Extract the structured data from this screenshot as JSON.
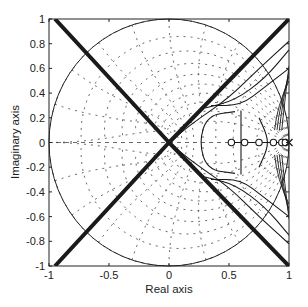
{
  "chart_data": {
    "type": "line",
    "title": "",
    "xlabel": "Real axis",
    "ylabel": "Imaginary axis",
    "xlim": [
      -1,
      1
    ],
    "ylim": [
      -1,
      1
    ],
    "grid": "zgrid (damping/natural-frequency dotted grid)",
    "legend": "none",
    "xticks": [
      -1,
      -0.5,
      0,
      0.5,
      1
    ],
    "xtick_labels": [
      "-1",
      "-0.5",
      "0",
      "0.5",
      "1"
    ],
    "yticks": [
      1,
      0.8,
      0.6,
      0.4,
      0.2,
      0,
      -0.2,
      -0.4,
      -0.6,
      -0.8,
      -1
    ],
    "ytick_labels": [
      "1",
      "0.8",
      "0.6",
      "0.4",
      "0.2",
      "0",
      "-0.2",
      "-0.4",
      "-0.6",
      "-0.8",
      "-1"
    ],
    "unit_circle": {
      "center": [
        0,
        0
      ],
      "radius": 1
    },
    "poles": [
      [
        1.0,
        0
      ]
    ],
    "zeros": [
      [
        0.52,
        0
      ],
      [
        0.63,
        0
      ],
      [
        0.75,
        0
      ],
      [
        0.87,
        0
      ],
      [
        0.94,
        0
      ],
      [
        0.97,
        0
      ]
    ],
    "series": [
      {
        "name": "asymptote-diagonal-1",
        "style": "thick",
        "points": [
          [
            -0.95,
            1
          ],
          [
            0,
            0
          ],
          [
            1,
            -1
          ]
        ]
      },
      {
        "name": "asymptote-diagonal-2",
        "style": "thick",
        "points": [
          [
            -0.95,
            -1
          ],
          [
            0,
            0
          ],
          [
            1,
            1
          ]
        ]
      },
      {
        "name": "branch-upper-outer",
        "points": [
          [
            0,
            0
          ],
          [
            0.2,
            0.16
          ],
          [
            0.5,
            0.36
          ],
          [
            0.75,
            0.6
          ],
          [
            1,
            0.82
          ]
        ]
      },
      {
        "name": "branch-upper-mid",
        "points": [
          [
            0.3,
            0.28
          ],
          [
            0.55,
            0.34
          ],
          [
            0.8,
            0.52
          ],
          [
            1,
            0.75
          ]
        ]
      },
      {
        "name": "branch-upper-inner",
        "points": [
          [
            0.35,
            0.3
          ],
          [
            0.6,
            0.3
          ],
          [
            0.8,
            0.45
          ],
          [
            1,
            0.6
          ]
        ]
      },
      {
        "name": "branch-lower-outer",
        "points": [
          [
            0,
            0
          ],
          [
            0.2,
            -0.16
          ],
          [
            0.5,
            -0.36
          ],
          [
            0.75,
            -0.6
          ],
          [
            1,
            -0.82
          ]
        ]
      },
      {
        "name": "branch-lower-mid",
        "points": [
          [
            0.3,
            -0.28
          ],
          [
            0.55,
            -0.34
          ],
          [
            0.8,
            -0.52
          ],
          [
            1,
            -0.75
          ]
        ]
      },
      {
        "name": "branch-lower-inner",
        "points": [
          [
            0.35,
            -0.3
          ],
          [
            0.6,
            -0.3
          ],
          [
            0.8,
            -0.45
          ],
          [
            1,
            -0.6
          ]
        ]
      },
      {
        "name": "loop-left",
        "points": [
          [
            0.55,
            0.25
          ],
          [
            0.32,
            0.22
          ],
          [
            0.25,
            0
          ],
          [
            0.32,
            -0.22
          ],
          [
            0.55,
            -0.25
          ]
        ]
      },
      {
        "name": "loop-right-vertical",
        "points": [
          [
            0.6,
            0.26
          ],
          [
            0.6,
            -0.26
          ]
        ]
      },
      {
        "name": "loop-small-right",
        "points": [
          [
            0.75,
            0.2
          ],
          [
            0.82,
            0.05
          ],
          [
            0.82,
            -0.05
          ],
          [
            0.75,
            -0.2
          ]
        ]
      }
    ]
  }
}
